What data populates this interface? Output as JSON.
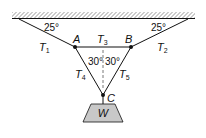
{
  "diagram": {
    "type": "statics-free-body",
    "ceiling": {
      "label": "ceiling-support",
      "hatched": true
    },
    "nodes": {
      "A": {
        "label": "A"
      },
      "B": {
        "label": "B"
      },
      "C": {
        "label": "C"
      }
    },
    "tensions": {
      "T1": {
        "main": "T",
        "sub": "1"
      },
      "T2": {
        "main": "T",
        "sub": "2"
      },
      "T3": {
        "main": "T",
        "sub": "3"
      },
      "T4": {
        "main": "T",
        "sub": "4"
      },
      "T5": {
        "main": "T",
        "sub": "5"
      }
    },
    "angles": {
      "left_ceiling": "25°",
      "right_ceiling": "25°",
      "left_vertical": "30°",
      "right_vertical": "30°"
    },
    "weight": {
      "label": "W",
      "fill": "#c8c8c8"
    },
    "colors": {
      "line": "#111111",
      "dashed": "#555555",
      "background": "#ffffff"
    }
  }
}
